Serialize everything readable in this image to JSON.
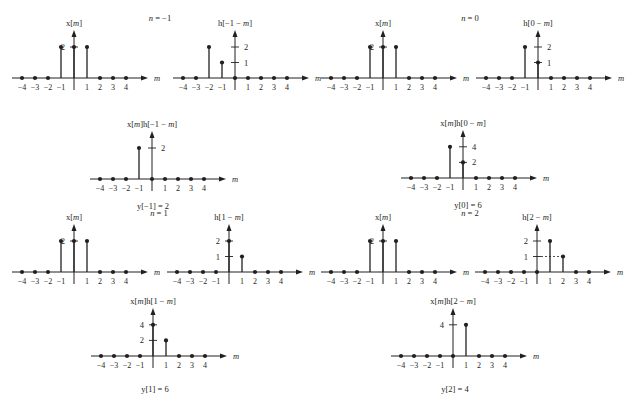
{
  "figure": {
    "axis_variable": "m",
    "tick_labels": [
      "−4",
      "−3",
      "−2",
      "−1",
      "",
      "1",
      "2",
      "3",
      "4"
    ],
    "colors": {
      "ink": "#231f20",
      "background": "#ffffff"
    }
  },
  "chart_data": [
    {
      "type": "stem",
      "quadrant": "top-left",
      "n": -1,
      "n_label": "n = −1",
      "panels": [
        {
          "role": "x",
          "title": "x[m]",
          "m": [
            -4,
            -3,
            -2,
            -1,
            0,
            1,
            2,
            3,
            4
          ],
          "values": [
            0,
            0,
            0,
            2,
            2,
            2,
            0,
            0,
            0
          ],
          "yticks": [
            2
          ],
          "ytick_side": "left"
        },
        {
          "role": "h",
          "title": "h[−1 − m]",
          "m": [
            -4,
            -3,
            -2,
            -1,
            0,
            1,
            2,
            3,
            4
          ],
          "values": [
            0,
            0,
            2,
            1,
            0,
            0,
            0,
            0,
            0
          ],
          "yticks": [
            1,
            2
          ],
          "ytick_side": "right"
        },
        {
          "role": "product",
          "title": "x[m]h[−1 − m]",
          "m": [
            -4,
            -3,
            -2,
            -1,
            0,
            1,
            2,
            3,
            4
          ],
          "values": [
            0,
            0,
            0,
            2,
            0,
            0,
            0,
            0,
            0
          ],
          "yticks": [
            2
          ],
          "ytick_side": "right"
        }
      ],
      "result": "y[−1] = 2"
    },
    {
      "type": "stem",
      "quadrant": "top-right",
      "n": 0,
      "n_label": "n = 0",
      "panels": [
        {
          "role": "x",
          "title": "x[m]",
          "m": [
            -4,
            -3,
            -2,
            -1,
            0,
            1,
            2,
            3,
            4
          ],
          "values": [
            0,
            0,
            0,
            2,
            2,
            2,
            0,
            0,
            0
          ],
          "yticks": [
            2
          ],
          "ytick_side": "left"
        },
        {
          "role": "h",
          "title": "h[0 − m]",
          "m": [
            -4,
            -3,
            -2,
            -1,
            0,
            1,
            2,
            3,
            4
          ],
          "values": [
            0,
            0,
            0,
            2,
            1,
            0,
            0,
            0,
            0
          ],
          "yticks": [
            1,
            2
          ],
          "ytick_side": "right"
        },
        {
          "role": "product",
          "title": "x[m]h[0 − m]",
          "m": [
            -4,
            -3,
            -2,
            -1,
            0,
            1,
            2,
            3,
            4
          ],
          "values": [
            0,
            0,
            0,
            4,
            2,
            0,
            0,
            0,
            0
          ],
          "yticks": [
            2,
            4
          ],
          "ytick_side": "right"
        }
      ],
      "result": "y[0] = 6"
    },
    {
      "type": "stem",
      "quadrant": "bottom-left",
      "n": 1,
      "n_label": "n = 1",
      "panels": [
        {
          "role": "x",
          "title": "x[m]",
          "m": [
            -4,
            -3,
            -2,
            -1,
            0,
            1,
            2,
            3,
            4
          ],
          "values": [
            0,
            0,
            0,
            2,
            2,
            2,
            0,
            0,
            0
          ],
          "yticks": [
            2
          ],
          "ytick_side": "left"
        },
        {
          "role": "h",
          "title": "h[1 − m]",
          "m": [
            -4,
            -3,
            -2,
            -1,
            0,
            1,
            2,
            3,
            4
          ],
          "values": [
            0,
            0,
            0,
            0,
            2,
            1,
            0,
            0,
            0
          ],
          "yticks": [
            1,
            2
          ],
          "ytick_side": "left"
        },
        {
          "role": "product",
          "title": "x[m]h[1 − m]",
          "m": [
            -4,
            -3,
            -2,
            -1,
            0,
            1,
            2,
            3,
            4
          ],
          "values": [
            0,
            0,
            0,
            0,
            4,
            2,
            0,
            0,
            0
          ],
          "yticks": [
            2,
            4
          ],
          "ytick_side": "left"
        }
      ],
      "result": "y[1] = 6"
    },
    {
      "type": "stem",
      "quadrant": "bottom-right",
      "n": 2,
      "n_label": "n = 2",
      "panels": [
        {
          "role": "x",
          "title": "x[m]",
          "m": [
            -4,
            -3,
            -2,
            -1,
            0,
            1,
            2,
            3,
            4
          ],
          "values": [
            0,
            0,
            0,
            2,
            2,
            2,
            0,
            0,
            0
          ],
          "yticks": [
            2
          ],
          "ytick_side": "left"
        },
        {
          "role": "h",
          "title": "h[2 − m]",
          "m": [
            -4,
            -3,
            -2,
            -1,
            0,
            1,
            2,
            3,
            4
          ],
          "values": [
            0,
            0,
            0,
            0,
            0,
            2,
            1,
            0,
            0
          ],
          "yticks": [
            1,
            2
          ],
          "ytick_side": "left",
          "dashed_guide_to": 2
        },
        {
          "role": "product",
          "title": "x[m]h[2 − m]",
          "m": [
            -4,
            -3,
            -2,
            -1,
            0,
            1,
            2,
            3,
            4
          ],
          "values": [
            0,
            0,
            0,
            0,
            0,
            4,
            0,
            0,
            0
          ],
          "yticks": [
            4
          ],
          "ytick_side": "left"
        }
      ],
      "result": "y[2] = 4"
    }
  ]
}
